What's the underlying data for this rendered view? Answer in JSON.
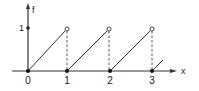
{
  "diagram": {
    "type": "sawtooth-function-plot",
    "axes": {
      "y_label": "f",
      "x_label": "x",
      "y_tick_label": "1",
      "x_tick_labels": [
        "0",
        "1",
        "2",
        "3"
      ]
    },
    "function": {
      "description": "f(x) = x - floor(x), sawtooth with period 1",
      "segments": [
        {
          "from": [
            0,
            0
          ],
          "to": [
            1,
            1
          ],
          "start": "closed",
          "end": "open"
        },
        {
          "from": [
            1,
            0
          ],
          "to": [
            2,
            1
          ],
          "start": "closed",
          "end": "open"
        },
        {
          "from": [
            2,
            0
          ],
          "to": [
            3,
            1
          ],
          "start": "closed",
          "end": "open"
        },
        {
          "from": [
            3,
            0
          ],
          "to": [
            3.25,
            0.25
          ],
          "start": "closed",
          "end": "continues"
        }
      ],
      "dashed_verticals_at": [
        1,
        2,
        3
      ],
      "y_axis_marker_at": 1
    },
    "colors": {
      "line": "#333333",
      "background": "#ffffff"
    }
  }
}
